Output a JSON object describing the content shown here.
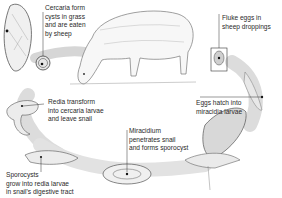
{
  "diagram": {
    "colors": {
      "background": "#ffffff",
      "path_band": "#dcdcdc",
      "ink": "#2a2a2a",
      "leader": "#333333"
    },
    "labels": [
      {
        "id": "cercaria",
        "text": "Cercaria form\ncysts in grass\nand are eaten\nby sheep"
      },
      {
        "id": "fluke-eggs",
        "text": "Fluke eggs in\nsheep droppings"
      },
      {
        "id": "eggs-hatch",
        "text": "Eggs hatch into\nmiracidia larvae"
      },
      {
        "id": "redia",
        "text": "Redia transform\ninto cercaria larvae\nand leave snail"
      },
      {
        "id": "miracidium",
        "text": "Miracidium\npenetrates snail\nand forms sporocyst"
      },
      {
        "id": "sporocysts",
        "text": "Sporocysts\ngrow into redia larvae\nin snail's digestive tract"
      }
    ],
    "illustrations": [
      {
        "name": "adult-fluke"
      },
      {
        "name": "sheep"
      },
      {
        "name": "cercaria-cyst"
      },
      {
        "name": "fluke-egg"
      },
      {
        "name": "miracidia-larva"
      },
      {
        "name": "snail"
      },
      {
        "name": "sporocyst"
      },
      {
        "name": "redia"
      }
    ]
  }
}
